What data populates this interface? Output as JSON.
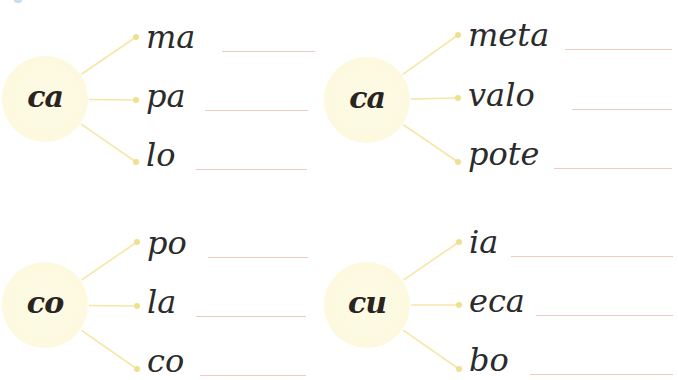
{
  "colors": {
    "circle_fill": "#fcf9df",
    "connector": "#f5e7a8",
    "dot": "#efdf8f",
    "write_line": "#f0c9c4",
    "ink": "#2b2b2b"
  },
  "exercises": [
    {
      "syllable": "ca",
      "words": [
        {
          "text": "ma",
          "dot": [
            136,
            37
          ],
          "line": {
            "x1": 222,
            "x2": 315,
            "y": 51
          }
        },
        {
          "text": "pa",
          "dot": [
            136,
            100
          ],
          "line": {
            "x1": 205,
            "x2": 308,
            "y": 110
          }
        },
        {
          "text": "lo",
          "dot": [
            136,
            162
          ],
          "line": {
            "x1": 196,
            "x2": 307,
            "y": 169
          }
        }
      ],
      "circle": {
        "cx": 45,
        "cy": 99
      }
    },
    {
      "syllable": "ca",
      "words": [
        {
          "text": "meta",
          "dot": [
            458,
            35
          ],
          "line": {
            "x1": 565,
            "x2": 672,
            "y": 49
          }
        },
        {
          "text": "valo",
          "dot": [
            458,
            98
          ],
          "line": {
            "x1": 572,
            "x2": 672,
            "y": 109
          }
        },
        {
          "text": "pote",
          "dot": [
            458,
            162
          ],
          "line": {
            "x1": 554,
            "x2": 672,
            "y": 168
          }
        }
      ],
      "circle": {
        "cx": 367,
        "cy": 100
      }
    },
    {
      "syllable": "co",
      "words": [
        {
          "text": "po",
          "dot": [
            137,
            242
          ],
          "line": {
            "x1": 208,
            "x2": 308,
            "y": 257
          }
        },
        {
          "text": "la",
          "dot": [
            137,
            306
          ],
          "line": {
            "x1": 196,
            "x2": 306,
            "y": 316
          }
        },
        {
          "text": "co",
          "dot": [
            137,
            369
          ],
          "line": {
            "x1": 200,
            "x2": 306,
            "y": 375
          }
        }
      ],
      "circle": {
        "cx": 45,
        "cy": 305
      }
    },
    {
      "syllable": "cu",
      "words": [
        {
          "text": "ia",
          "dot": [
            459,
            242
          ],
          "line": {
            "x1": 511,
            "x2": 673,
            "y": 256
          }
        },
        {
          "text": "eca",
          "dot": [
            459,
            305
          ],
          "line": {
            "x1": 536,
            "x2": 673,
            "y": 315
          }
        },
        {
          "text": "bo",
          "dot": [
            459,
            369
          ],
          "line": {
            "x1": 530,
            "x2": 673,
            "y": 374
          }
        }
      ],
      "circle": {
        "cx": 367,
        "cy": 305
      }
    }
  ]
}
